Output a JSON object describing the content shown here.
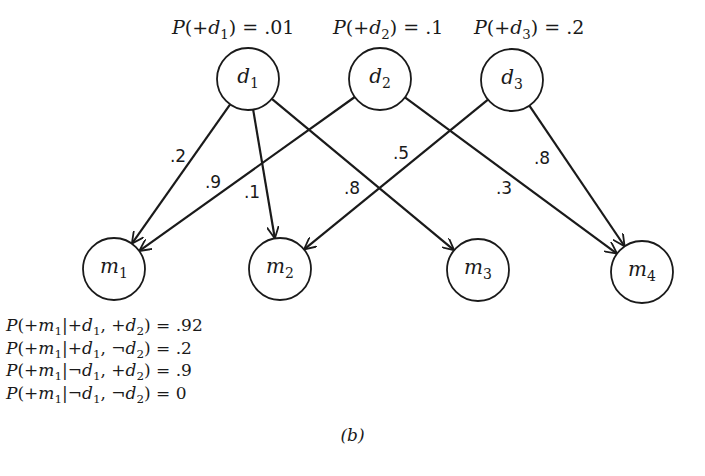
{
  "priors": [
    {
      "node": "d1",
      "text_prefix": "P(+",
      "var": "d",
      "sub": "1",
      "text_suffix": ") = .01",
      "x": 172
    },
    {
      "node": "d2",
      "text_prefix": "P(+",
      "var": "d",
      "sub": "2",
      "text_suffix": ") = .1",
      "x": 333
    },
    {
      "node": "d3",
      "text_prefix": "P(+",
      "var": "d",
      "sub": "3",
      "text_suffix": ") = .2",
      "x": 474
    }
  ],
  "nodes": [
    {
      "id": "d1",
      "var": "d",
      "sub": "1",
      "cx": 248,
      "cy": 79,
      "r": 31
    },
    {
      "id": "d2",
      "var": "d",
      "sub": "2",
      "cx": 380,
      "cy": 79,
      "r": 31
    },
    {
      "id": "d3",
      "var": "d",
      "sub": "3",
      "cx": 512,
      "cy": 80,
      "r": 31
    },
    {
      "id": "m1",
      "var": "m",
      "sub": "1",
      "cx": 114,
      "cy": 269,
      "r": 31
    },
    {
      "id": "m2",
      "var": "m",
      "sub": "2",
      "cx": 280,
      "cy": 269,
      "r": 31
    },
    {
      "id": "m3",
      "var": "m",
      "sub": "3",
      "cx": 478,
      "cy": 270,
      "r": 31
    },
    {
      "id": "m4",
      "var": "m",
      "sub": "4",
      "cx": 642,
      "cy": 272,
      "r": 31
    }
  ],
  "edges": [
    {
      "from": "d1",
      "to": "m1",
      "weight": ".2",
      "lx": 178,
      "ly": 156
    },
    {
      "from": "d1",
      "to": "m2",
      "weight": ".1",
      "lx": 252,
      "ly": 192
    },
    {
      "from": "d1",
      "to": "m3",
      "weight": ".8",
      "lx": 352,
      "ly": 188
    },
    {
      "from": "d2",
      "to": "m1",
      "weight": ".9",
      "lx": 213,
      "ly": 182
    },
    {
      "from": "d2",
      "to": "m4",
      "weight": ".3",
      "lx": 504,
      "ly": 188
    },
    {
      "from": "d3",
      "to": "m2",
      "weight": ".5",
      "lx": 401,
      "ly": 153
    },
    {
      "from": "d3",
      "to": "m4",
      "weight": ".8",
      "lx": 542,
      "ly": 158
    }
  ],
  "cpt": [
    {
      "m": "1",
      "cond1": "+",
      "cond2": "+",
      "value": ".92"
    },
    {
      "m": "1",
      "cond1": "+",
      "cond2": "¬",
      "value": ".2"
    },
    {
      "m": "1",
      "cond1": "¬",
      "cond2": "+",
      "value": ".9"
    },
    {
      "m": "1",
      "cond1": "¬",
      "cond2": "¬",
      "value": "0"
    }
  ],
  "caption": "(b)",
  "colors": {
    "ink": "#1a1a1a",
    "background": "#ffffff"
  }
}
